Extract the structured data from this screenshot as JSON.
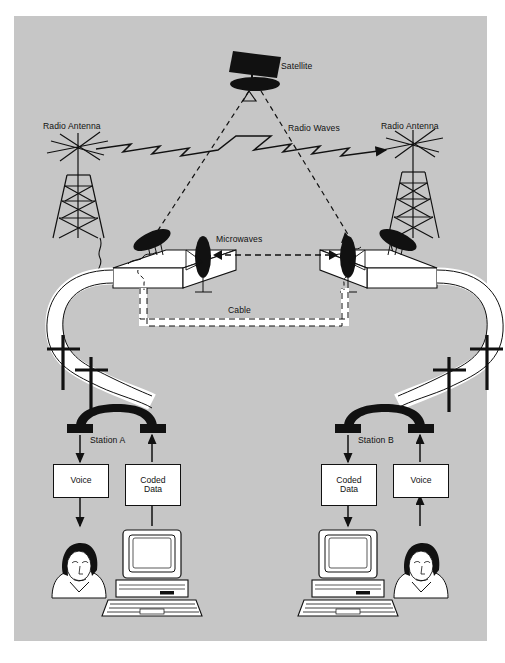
{
  "figure": {
    "background_color": "#c6c6c6",
    "page_color": "#ffffff",
    "ink_color": "#111111",
    "panel": {
      "x": 14,
      "y": 16,
      "width": 473,
      "height": 625
    }
  },
  "labels": {
    "satellite": "Satellite",
    "radio_antenna_left": "Radio Antenna",
    "radio_antenna_right": "Radio Antenna",
    "radio_waves": "Radio Waves",
    "microwaves": "Microwaves",
    "cable": "Cable",
    "station_a": "Station A",
    "station_b": "Station B"
  },
  "boxes": {
    "a_voice": "Voice",
    "a_coded_data": "Coded\nData",
    "a_coded_data_line1": "Coded",
    "a_coded_data_line2": "Data",
    "b_coded_data_line1": "Coded",
    "b_coded_data_line2": "Data",
    "b_voice": "Voice"
  },
  "icons": {
    "satellite": "satellite-icon",
    "antenna_left": "radio-antenna-tower-icon",
    "antenna_right": "radio-antenna-tower-icon",
    "dish_left_up": "satellite-dish-icon",
    "dish_left_side": "microwave-dish-icon",
    "dish_right_side": "microwave-dish-icon",
    "dish_right_up": "satellite-dish-icon",
    "ground_station_left": "ground-station-building-icon",
    "ground_station_right": "ground-station-building-icon",
    "handset_a": "telephone-handset-icon",
    "handset_b": "telephone-handset-icon",
    "person_a": "person-head-icon",
    "person_b": "person-head-icon",
    "computer_a": "desktop-computer-icon",
    "computer_b": "desktop-computer-icon",
    "pole_a1": "telephone-pole-icon",
    "pole_a2": "telephone-pole-icon",
    "pole_b1": "telephone-pole-icon",
    "pole_b2": "telephone-pole-icon"
  },
  "links": [
    {
      "name": "satellite-uplink-left",
      "style": "dashed",
      "from": "ground-station-left-dish",
      "to": "satellite"
    },
    {
      "name": "satellite-downlink-right",
      "style": "dashed",
      "from": "satellite",
      "to": "ground-station-right-dish"
    },
    {
      "name": "radio-waves-link",
      "style": "zigzag-arrow",
      "from": "radio-antenna-left",
      "to": "radio-antenna-right"
    },
    {
      "name": "microwave-link",
      "style": "dashed-double-arrow",
      "from": "microwave-dish-left",
      "to": "microwave-dish-right"
    },
    {
      "name": "cable-link",
      "style": "white-ribbon-dashed",
      "from": "ground-station-left",
      "to": "ground-station-right"
    }
  ]
}
